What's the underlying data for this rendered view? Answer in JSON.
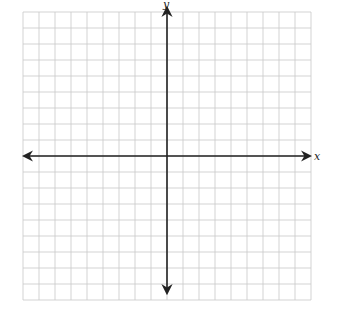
{
  "diagram": {
    "type": "coordinate-plane",
    "x_axis_label": "x",
    "y_axis_label": "y",
    "grid": {
      "cells_left_of_y_axis": 9,
      "cells_right_of_y_axis": 9,
      "cells_above_x_axis": 9,
      "cells_below_x_axis": 9,
      "line_color": "#c8c8c8",
      "axis_color": "#222222"
    },
    "tick_labels": []
  }
}
